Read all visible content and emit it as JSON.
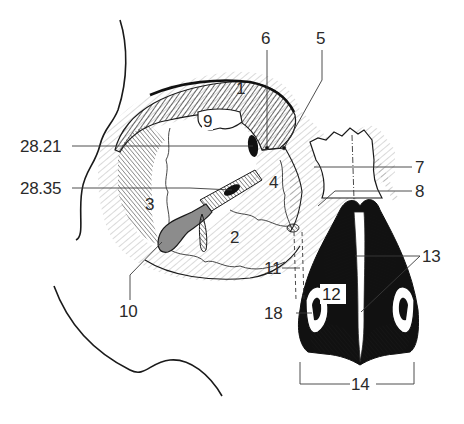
{
  "figure": {
    "type": "anatomical-line-drawing",
    "colors": {
      "ink": "#1a1a1a",
      "leader": "#3a3a3a",
      "fill_gray": "#8c8c8c",
      "background": "#ffffff"
    }
  },
  "labels": {
    "l1": "1",
    "l2": "2",
    "l3": "3",
    "l4": "4",
    "l5": "5",
    "l6": "6",
    "l7": "7",
    "l8": "8",
    "l9": "9",
    "l10": "10",
    "l11": "11",
    "l12": "12",
    "l13": "13",
    "l14": "14",
    "l18": "18",
    "l28_21": "28.21",
    "l28_35": "28.35"
  }
}
